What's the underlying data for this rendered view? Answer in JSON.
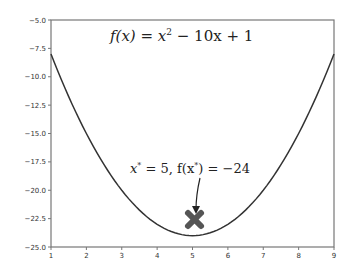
{
  "chart_data": {
    "type": "line",
    "title": "",
    "xlabel": "",
    "ylabel": "",
    "xlim": [
      1,
      9
    ],
    "ylim": [
      -25.0,
      -5.0
    ],
    "grid": false,
    "legend": null,
    "x_ticks": [
      "1",
      "2",
      "3",
      "4",
      "5",
      "6",
      "7",
      "8",
      "9"
    ],
    "y_ticks": [
      "-5.0",
      "-7.5",
      "-10.0",
      "-12.5",
      "-15.0",
      "-17.5",
      "-20.0",
      "-22.5",
      "-25.0"
    ],
    "series": [
      {
        "name": "f(x) = x^2 - 10x + 1",
        "x": [
          1,
          1.5,
          2,
          2.5,
          3,
          3.5,
          4,
          4.5,
          5,
          5.5,
          6,
          6.5,
          7,
          7.5,
          8,
          8.5,
          9
        ],
        "values": [
          -8,
          -11.75,
          -15,
          -17.75,
          -20,
          -21.75,
          -23,
          -23.75,
          -24,
          -23.75,
          -23,
          -21.75,
          -20,
          -17.75,
          -15,
          -11.75,
          -8
        ],
        "color": "#333333"
      }
    ],
    "markers": [
      {
        "x": 5,
        "y": -24,
        "shape": "X",
        "color": "#555555"
      }
    ],
    "annotations": [
      {
        "text_parts": [
          "f(x) = x",
          "2",
          " − 10x + 1"
        ],
        "position": "top-center"
      },
      {
        "text_parts": [
          "x",
          "*",
          " = 5, f(x",
          "*",
          ") = −24"
        ],
        "arrow_to": [
          5,
          -24
        ]
      }
    ]
  }
}
